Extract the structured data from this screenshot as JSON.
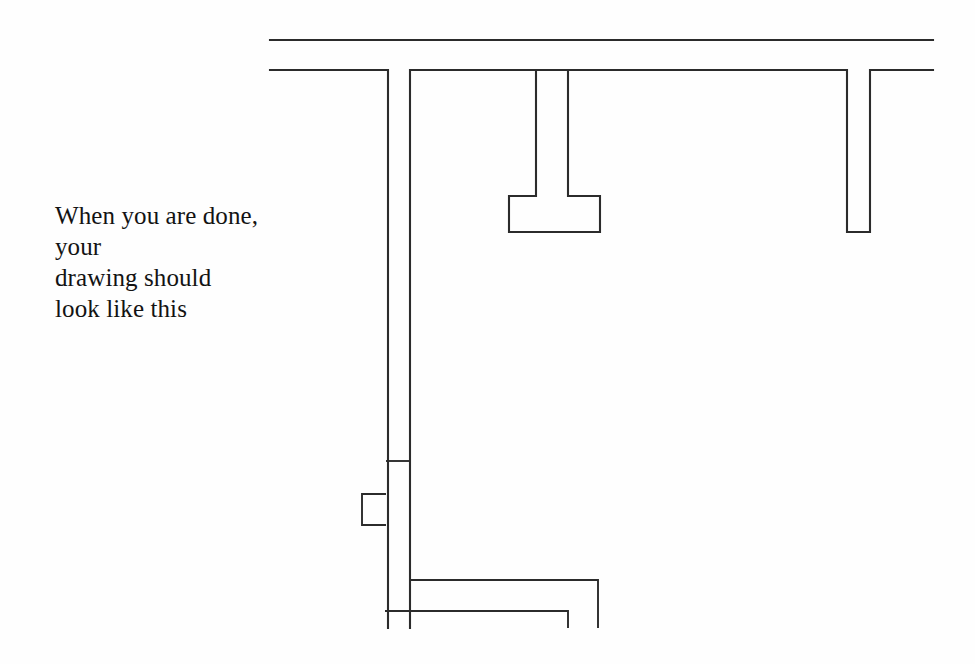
{
  "page": {
    "background_color": "#ffffff",
    "width": 975,
    "height": 664
  },
  "instruction": {
    "text": "When you are done, your\ndrawing should\nlook like this",
    "color": "#131313",
    "font_size_px": 25
  },
  "drawing": {
    "name": "profile-line-drawing",
    "stroke_color": "#2b2b2b",
    "stroke_width": 2,
    "description": "Technical line drawing of a cross-section profile with rectangular notches",
    "segments": {
      "top_rule": "M 270 40 L 933 40",
      "main_outline": "M 270 70 L 388 70 L 388 628 M 410 628 L 410 70 L 568 70 L 568 196 L 600 196 L 600 232 L 509 232 L 509 196 L 536 196 L 536 70 L 847 70 L 847 232 L 870 232 L 870 70 L 933 70",
      "lower_detail_1": "M 386 461 L 410 461",
      "lower_notch": "M 386 494 L 362 494 L 362 525 L 386 525",
      "lower_shelf_upper": "M 410 580 L 598 580 L 598 628",
      "lower_shelf_lower": "M 385 611 L 568 611 L 568 628"
    }
  }
}
